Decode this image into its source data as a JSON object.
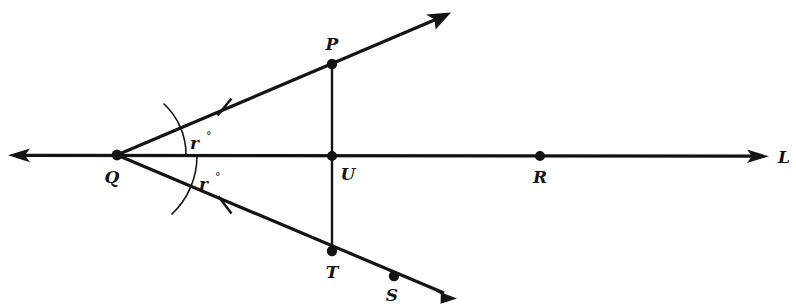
{
  "figure": {
    "kind": "geometry-diagram",
    "background_color": "#ffffff",
    "ink_color": "#141414",
    "width": 796,
    "height": 308,
    "points": [
      {
        "id": "Q",
        "label": "Q",
        "x": 117,
        "y": 155,
        "label_x": 112,
        "label_y": 183,
        "has_dot": true
      },
      {
        "id": "P",
        "label": "P",
        "x": 332,
        "y": 64,
        "label_x": 332,
        "label_y": 50,
        "has_dot": true
      },
      {
        "id": "U",
        "label": "U",
        "x": 332,
        "y": 156,
        "label_x": 348,
        "label_y": 180,
        "has_dot": true
      },
      {
        "id": "R",
        "label": "R",
        "x": 540,
        "y": 156,
        "label_x": 540,
        "label_y": 183,
        "has_dot": true
      },
      {
        "id": "T",
        "label": "T",
        "x": 332,
        "y": 251,
        "label_x": 332,
        "label_y": 278,
        "has_dot": true
      },
      {
        "id": "S",
        "label": "S",
        "x": 394,
        "y": 276,
        "label_x": 392,
        "label_y": 301,
        "has_dot": true
      }
    ],
    "line_labels": [
      {
        "id": "L",
        "label": "L",
        "x": 784,
        "y": 163
      }
    ],
    "angles": [
      {
        "id": "angle-upper",
        "label": "r",
        "degree_symbol": "°",
        "vertex": "Q",
        "label_x": 190,
        "label_y": 149,
        "deg_x": 206,
        "deg_y": 140
      },
      {
        "id": "angle-lower",
        "label": "r",
        "degree_symbol": "°",
        "vertex": "Q",
        "label_x": 199,
        "label_y": 190,
        "deg_x": 215,
        "deg_y": 181
      }
    ],
    "congruence_ticks": [
      {
        "id": "tick-QP",
        "segment": "QP",
        "x": 224,
        "y": 107
      },
      {
        "id": "tick-QT",
        "segment": "QT",
        "x": 225,
        "y": 205
      }
    ],
    "segments": [
      {
        "id": "line-L",
        "name": "horizontal-line-L",
        "from": "left-arrow",
        "to": "right-arrow",
        "arrow_both_ends": true
      },
      {
        "id": "ray-QP",
        "name": "ray-Q-through-P",
        "from": "Q",
        "to": "P",
        "arrow_at_end": true
      },
      {
        "id": "ray-QT",
        "name": "ray-Q-through-T-S",
        "from": "Q",
        "to": "S",
        "arrow_at_end": true
      },
      {
        "id": "seg-PT",
        "name": "vertical-segment-P-T",
        "from": "P",
        "to": "T",
        "arrow_at_end": false
      }
    ]
  }
}
